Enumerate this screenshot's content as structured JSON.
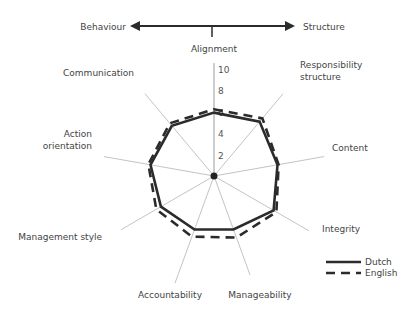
{
  "chart_data": {
    "type": "radar",
    "title": "",
    "top_axis": {
      "left_label": "Behaviour",
      "right_label": "Structure"
    },
    "axes": [
      {
        "label": [
          "Alignment"
        ]
      },
      {
        "label": [
          "Responsibility",
          "structure"
        ]
      },
      {
        "label": [
          "Content"
        ]
      },
      {
        "label": [
          "Integrity"
        ]
      },
      {
        "label": [
          "Manageability"
        ]
      },
      {
        "label": [
          "Accountability"
        ]
      },
      {
        "label": [
          "Management style"
        ]
      },
      {
        "label": [
          "Action",
          "orientation"
        ]
      },
      {
        "label": [
          "Communication"
        ]
      }
    ],
    "categories": [
      "Alignment",
      "Responsibility structure",
      "Content",
      "Integrity",
      "Manageability",
      "Accountability",
      "Management style",
      "Action orientation",
      "Communication"
    ],
    "rlim": [
      0,
      10
    ],
    "ticks": [
      "2",
      "4",
      "6",
      "8",
      "10"
    ],
    "tick_values": [
      2,
      4,
      6,
      8,
      10
    ],
    "series": [
      {
        "name": "Dutch",
        "style": "solid",
        "color": "#2b2b2b",
        "values": [
          5.9,
          6.6,
          6.0,
          6.4,
          5.3,
          5.3,
          5.7,
          6.0,
          6.1
        ]
      },
      {
        "name": "English",
        "style": "dashed",
        "color": "#2b2b2b",
        "values": [
          6.2,
          7.0,
          6.1,
          6.7,
          6.1,
          6.0,
          6.2,
          6.2,
          6.4
        ]
      }
    ],
    "legend": {
      "position": "bottom-right",
      "entries": [
        "Dutch",
        "English"
      ]
    },
    "grid": false
  }
}
